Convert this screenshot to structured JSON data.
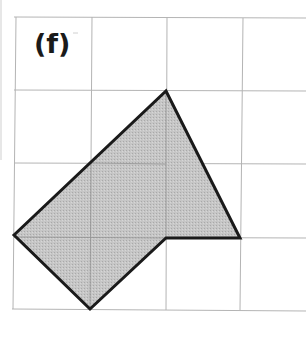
{
  "figure": {
    "label": "(f)",
    "grid": {
      "vertical_lines_x": [
        14,
        90,
        166,
        241
      ],
      "horizontal_lines_y": [
        17,
        90,
        163,
        237,
        310
      ],
      "left": 14,
      "right": 306,
      "top": 17,
      "bottom": 310,
      "cell_size": 75,
      "line_color": "#b0b0b0"
    },
    "shape": {
      "type": "polygon",
      "vertices_grid_units": [
        [
          0,
          3
        ],
        [
          2,
          1
        ],
        [
          3,
          3
        ],
        [
          2,
          3
        ],
        [
          1,
          4
        ]
      ],
      "points": "14,235 166,91 240,238 166,238 90,309",
      "fill": "#c4c4c4",
      "stroke": "#1a1a1a"
    },
    "left_margin_line": {
      "x": 1,
      "y1": 0,
      "y2": 160,
      "color": "#c8c8c8"
    }
  }
}
